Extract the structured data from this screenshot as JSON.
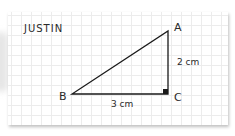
{
  "card": {
    "name": "JUSTIN"
  },
  "triangle": {
    "vertices": {
      "A": "A",
      "B": "B",
      "C": "C"
    },
    "sides": {
      "AC": "2 cm",
      "BC": "3 cm"
    },
    "right_angle_at": "C"
  },
  "colors": {
    "stroke": "#1a1a1a",
    "grid": "#ececec",
    "paper": "#ffffff"
  }
}
